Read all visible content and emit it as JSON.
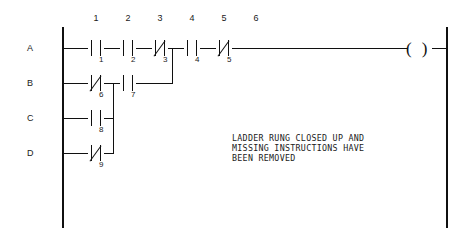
{
  "diagram": {
    "type": "ladder-logic-rung",
    "row_labels": [
      "A",
      "B",
      "C",
      "D"
    ],
    "column_labels": [
      "1",
      "2",
      "3",
      "4",
      "5",
      "6"
    ],
    "contacts": [
      {
        "number": "1",
        "row": "A",
        "kind": "normally-open"
      },
      {
        "number": "2",
        "row": "A",
        "kind": "normally-open"
      },
      {
        "number": "3",
        "row": "A",
        "kind": "normally-closed"
      },
      {
        "number": "4",
        "row": "A",
        "kind": "normally-open"
      },
      {
        "number": "5",
        "row": "A",
        "kind": "normally-closed"
      },
      {
        "number": "6",
        "row": "B",
        "kind": "normally-closed"
      },
      {
        "number": "7",
        "row": "B",
        "kind": "normally-open"
      },
      {
        "number": "8",
        "row": "C",
        "kind": "normally-open"
      },
      {
        "number": "9",
        "row": "D",
        "kind": "normally-closed"
      }
    ],
    "coil": {
      "symbol_left": "(",
      "symbol_right": ")",
      "label": ""
    },
    "annotation": {
      "line1": "LADDER RUNG CLOSED UP AND",
      "line2": "MISSING INSTRUCTIONS HAVE",
      "line3": "BEEN REMOVED"
    },
    "colors": {
      "line": "#101010",
      "text": "#1a1a1a",
      "background": "#ffffff"
    }
  }
}
